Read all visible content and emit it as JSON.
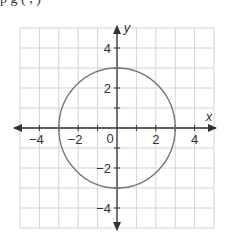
{
  "header": {
    "cut_text": "p               g            (   ,   )"
  },
  "chart_data": {
    "type": "line",
    "title": "",
    "xlabel": "x",
    "ylabel": "y",
    "xlim": [
      -5,
      5
    ],
    "ylim": [
      -5,
      5
    ],
    "grid": true,
    "x_tick_labels": [
      "-4",
      "-2",
      "0",
      "2",
      "4"
    ],
    "y_tick_labels": [
      "4",
      "2",
      "-2",
      "-4"
    ],
    "x_ticks": [
      -4,
      -3,
      -2,
      -1,
      1,
      2,
      3,
      4
    ],
    "y_ticks": [
      -4,
      -3,
      -2,
      -1,
      1,
      2,
      3,
      4
    ],
    "series": [
      {
        "name": "circle",
        "shape": "circle",
        "center": [
          0,
          0
        ],
        "radius": 3,
        "equation": "x^2 + y^2 = 9",
        "color": "#777777"
      }
    ],
    "legend": null
  },
  "colors": {
    "grid": "#d4d4d4",
    "axis": "#333333",
    "curve": "#777777",
    "text": "#333333"
  }
}
